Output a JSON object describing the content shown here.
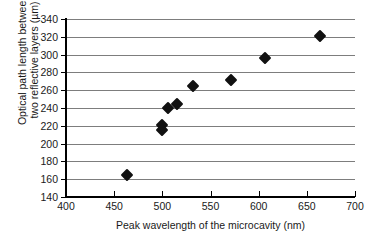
{
  "chart_data": {
    "type": "scatter",
    "title": "",
    "xlabel": "Peak wavelength of the microcavity (nm)",
    "ylabel_line1": "Optical path length between",
    "ylabel_line2": "two reflective layers (µm)",
    "xlim": [
      400,
      700
    ],
    "ylim": [
      140,
      340
    ],
    "xticks": [
      400,
      450,
      500,
      550,
      600,
      650,
      700
    ],
    "yticks": [
      140,
      160,
      180,
      200,
      220,
      240,
      260,
      280,
      300,
      320,
      340
    ],
    "grid": "horizontal",
    "legend": "none",
    "marker": "filled-diamond",
    "marker_color": "#111111",
    "gridline_color": "#7d7d7d",
    "axis_color": "#000000",
    "background_color": "#ffffff",
    "points": [
      {
        "x": 463,
        "y": 165
      },
      {
        "x": 500,
        "y": 221
      },
      {
        "x": 500,
        "y": 215
      },
      {
        "x": 506,
        "y": 240
      },
      {
        "x": 515,
        "y": 245
      },
      {
        "x": 532,
        "y": 265
      },
      {
        "x": 571,
        "y": 271
      },
      {
        "x": 607,
        "y": 296
      },
      {
        "x": 664,
        "y": 321
      }
    ]
  }
}
